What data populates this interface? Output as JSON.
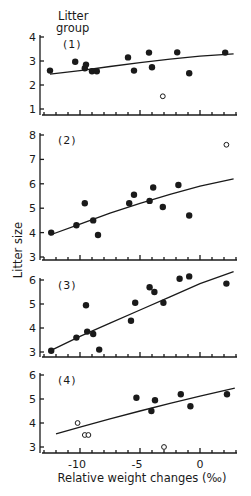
{
  "chart_data": {
    "type": "scatter",
    "title": "",
    "xlabel": "Relative weight changes (‰)",
    "ylabel": "Litter size",
    "legend_title": "Litter group",
    "xlim": [
      -13,
      3
    ],
    "x_ticks": [
      -10,
      -5,
      0
    ],
    "x_minor_tick_step": 1,
    "grid": false,
    "marker_legend": {
      "filled": "included",
      "open": "excluded / outlier"
    },
    "panels": [
      {
        "label": "(1)",
        "ylim": [
          1,
          4
        ],
        "y_ticks": [
          1,
          2,
          3,
          4
        ],
        "filled_points": [
          [
            -12.5,
            2.6
          ],
          [
            -10.4,
            2.97
          ],
          [
            -9.6,
            2.7
          ],
          [
            -9.5,
            2.85
          ],
          [
            -9.0,
            2.57
          ],
          [
            -8.6,
            2.57
          ],
          [
            -6.0,
            3.15
          ],
          [
            -5.5,
            2.6
          ],
          [
            -4.25,
            3.35
          ],
          [
            -4.0,
            2.74
          ],
          [
            -1.9,
            3.36
          ],
          [
            -0.9,
            2.49
          ],
          [
            2.1,
            3.35
          ]
        ],
        "open_points": [
          [
            -3.1,
            1.53
          ]
        ],
        "fit_curve": [
          [
            -12.5,
            2.45
          ],
          [
            -10,
            2.6
          ],
          [
            -7.5,
            2.77
          ],
          [
            -5,
            2.93
          ],
          [
            -2.5,
            3.08
          ],
          [
            0,
            3.2
          ],
          [
            2.8,
            3.3
          ]
        ]
      },
      {
        "label": "(2)",
        "ylim": [
          3,
          8
        ],
        "y_ticks": [
          3,
          4,
          5,
          6,
          7,
          8
        ],
        "filled_points": [
          [
            -12.4,
            4.0
          ],
          [
            -10.3,
            4.3
          ],
          [
            -9.6,
            5.2
          ],
          [
            -8.9,
            4.5
          ],
          [
            -8.5,
            3.9
          ],
          [
            -5.9,
            5.2
          ],
          [
            -5.5,
            5.55
          ],
          [
            -4.2,
            5.3
          ],
          [
            -3.9,
            5.85
          ],
          [
            -3.1,
            5.05
          ],
          [
            -1.8,
            5.95
          ],
          [
            -0.9,
            4.7
          ]
        ],
        "open_points": [
          [
            2.2,
            7.6
          ]
        ],
        "fit_curve": [
          [
            -12.5,
            3.9
          ],
          [
            -10,
            4.35
          ],
          [
            -7.5,
            4.8
          ],
          [
            -5,
            5.2
          ],
          [
            -2.5,
            5.57
          ],
          [
            0,
            5.9
          ],
          [
            2.8,
            6.2
          ]
        ]
      },
      {
        "label": "(3)",
        "ylim": [
          3,
          6
        ],
        "y_ticks": [
          3,
          4,
          5,
          6
        ],
        "filled_points": [
          [
            -12.4,
            3.05
          ],
          [
            -10.3,
            3.6
          ],
          [
            -9.5,
            4.95
          ],
          [
            -9.4,
            3.85
          ],
          [
            -8.9,
            3.75
          ],
          [
            -8.4,
            3.1
          ],
          [
            -5.75,
            4.3
          ],
          [
            -5.4,
            5.05
          ],
          [
            -4.2,
            5.7
          ],
          [
            -3.8,
            5.5
          ],
          [
            -3.05,
            5.05
          ],
          [
            -1.7,
            6.05
          ],
          [
            -0.9,
            6.15
          ],
          [
            2.2,
            5.85
          ]
        ],
        "open_points": [],
        "fit_curve": [
          [
            -12.5,
            3.05
          ],
          [
            -10,
            3.65
          ],
          [
            -7.5,
            4.2
          ],
          [
            -5,
            4.75
          ],
          [
            -2.5,
            5.3
          ],
          [
            0,
            5.85
          ],
          [
            2.8,
            6.35
          ]
        ]
      },
      {
        "label": "(4)",
        "ylim": [
          3,
          6
        ],
        "y_ticks": [
          3,
          4,
          5,
          6
        ],
        "filled_points": [
          [
            -5.3,
            5.05
          ],
          [
            -4.05,
            4.5
          ],
          [
            -3.75,
            4.95
          ],
          [
            -1.6,
            5.2
          ],
          [
            -0.8,
            4.7
          ],
          [
            2.25,
            5.2
          ]
        ],
        "open_points": [
          [
            -10.2,
            4.0
          ],
          [
            -9.6,
            3.5
          ],
          [
            -9.3,
            3.5
          ],
          [
            -3.0,
            3.0
          ]
        ],
        "fit_curve": [
          [
            -12,
            3.55
          ],
          [
            -10,
            3.83
          ],
          [
            -7.5,
            4.17
          ],
          [
            -5,
            4.5
          ],
          [
            -2.5,
            4.82
          ],
          [
            0,
            5.12
          ],
          [
            2.9,
            5.45
          ]
        ]
      }
    ]
  },
  "labels": {
    "legend_title_line1": "Litter",
    "legend_title_line2": "group",
    "y_axis_title": "Litter size",
    "x_axis_title": "Relative weight changes (‰)"
  },
  "layout": {
    "x0_px": 200,
    "px_per_unit_x": 12,
    "x_axis_start": -13,
    "x_axis_end": 3,
    "panels": [
      {
        "y_axis_px": 115,
        "top_val_px": 37,
        "px_per_unit_y": 24
      },
      {
        "y_axis_px": 260,
        "top_val_px": 135,
        "px_per_unit_y": 24.4
      },
      {
        "y_axis_px": 357,
        "top_val_px": 280,
        "px_per_unit_y": 24
      },
      {
        "y_axis_px": 453,
        "top_val_px": 375,
        "px_per_unit_y": 24
      }
    ],
    "colors": {
      "ink": "#1a1a1a",
      "background": "#ffffff"
    }
  }
}
